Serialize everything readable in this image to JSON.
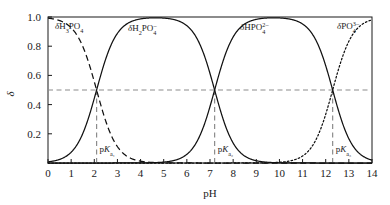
{
  "chart_data": {
    "type": "line",
    "title": "",
    "xlabel": "pH",
    "ylabel": "δ",
    "xlim": [
      0,
      14
    ],
    "ylim": [
      0,
      1.0
    ],
    "grid": false,
    "legend_position": "inline-labels",
    "x_ticks": [
      "0",
      "1",
      "2",
      "3",
      "4",
      "5",
      "6",
      "7",
      "8",
      "9",
      "10",
      "11",
      "12",
      "13",
      "14"
    ],
    "x_tick_values": [
      0,
      1,
      2,
      3,
      4,
      5,
      6,
      7,
      8,
      9,
      10,
      11,
      12,
      13,
      14
    ],
    "y_ticks": [
      "0.2",
      "0.4",
      "0.6",
      "0.8",
      "1.0"
    ],
    "y_tick_values": [
      0.2,
      0.4,
      0.6,
      0.8,
      1.0
    ],
    "pka_values": [
      2.1,
      7.2,
      12.3
    ],
    "reference_level": 0.5,
    "series": [
      {
        "name": "δ H3PO4",
        "label_base": "δ",
        "label_formula": "H3PO4",
        "style": "dashed",
        "protons": 3
      },
      {
        "name": "δ H2PO4-",
        "label_base": "δ",
        "label_formula": "H2PO4-",
        "style": "solid",
        "protons": 2
      },
      {
        "name": "δ HPO4 2-",
        "label_base": "δ",
        "label_formula": "HPO4 2-",
        "style": "solid",
        "protons": 1
      },
      {
        "name": "δ PO4 3-",
        "label_base": "δ",
        "label_formula": "PO4 3-",
        "style": "dotted",
        "protons": 0
      }
    ]
  },
  "axes": {
    "x_label": "pH",
    "y_label": "δ"
  },
  "annotations": {
    "pk1": {
      "base": "p",
      "italic": "K",
      "sub": "a₁",
      "value": 2.1
    },
    "pk2": {
      "base": "p",
      "italic": "K",
      "sub": "a₂",
      "value": 7.2
    },
    "pk3": {
      "base": "p",
      "italic": "K",
      "sub": "a₃",
      "value": 12.3
    }
  },
  "species_labels": {
    "s1": {
      "delta": "δ",
      "main1": "H",
      "sub1": "3",
      "main2": "PO",
      "sub2": "4",
      "charge": ""
    },
    "s2": {
      "delta": "δ",
      "main1": "H",
      "sub1": "2",
      "main2": "PO",
      "sub2": "4",
      "charge": "–"
    },
    "s3": {
      "delta": "δ",
      "main1": "H",
      "sub1": "",
      "main2": "PO",
      "sub2": "4",
      "charge": "2–"
    },
    "s4": {
      "delta": "δ",
      "main1": "",
      "sub1": "",
      "main2": "PO",
      "sub2": "4",
      "charge": "3–"
    }
  },
  "colors": {
    "curve": "#111111",
    "guide": "#8c8c8c",
    "frame": "#1a1a1a",
    "background": "#ffffff"
  }
}
